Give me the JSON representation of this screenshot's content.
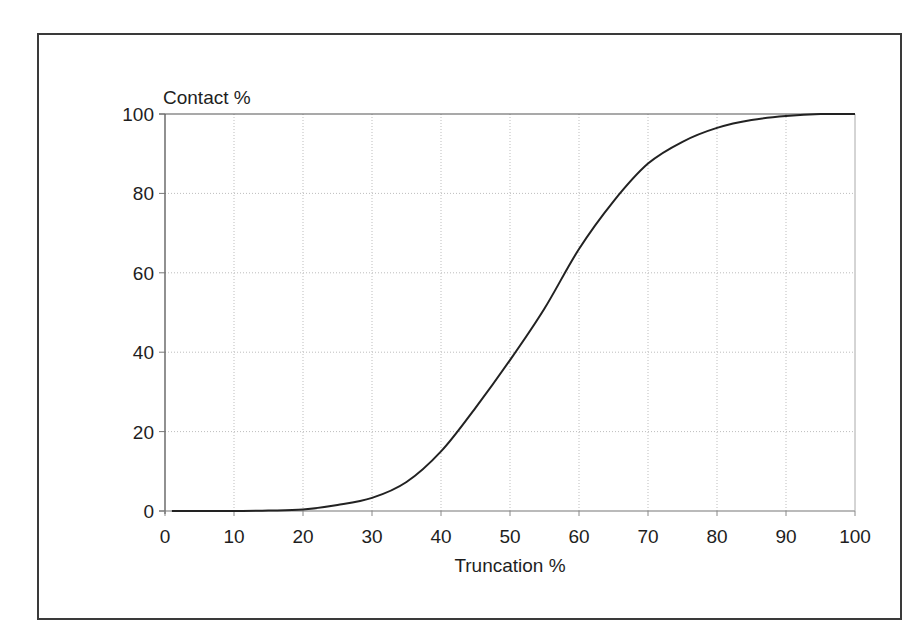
{
  "chart_data": {
    "type": "line",
    "title": "",
    "xlabel": "Truncation %",
    "ylabel": "Contact %",
    "xlim": [
      0,
      100
    ],
    "ylim": [
      0,
      100
    ],
    "x_ticks": [
      0,
      10,
      20,
      30,
      40,
      50,
      60,
      70,
      80,
      90,
      100
    ],
    "y_ticks": [
      0,
      20,
      40,
      60,
      80,
      100
    ],
    "grid": true,
    "grid_style": "dotted",
    "legend": null,
    "series": [
      {
        "name": "Contact",
        "color": "#222222",
        "x": [
          1,
          5,
          10,
          15,
          20,
          25,
          30,
          35,
          40,
          45,
          50,
          55,
          60,
          65,
          70,
          75,
          80,
          85,
          90,
          95,
          100
        ],
        "y": [
          0,
          0,
          0,
          0.1,
          0.4,
          1.5,
          3.3,
          7.3,
          15,
          26,
          38,
          51,
          66,
          78,
          87.5,
          93,
          96.5,
          98.5,
          99.5,
          100,
          100
        ]
      }
    ]
  },
  "axes": {
    "y_title": "Contact %",
    "x_title": "Truncation %"
  }
}
